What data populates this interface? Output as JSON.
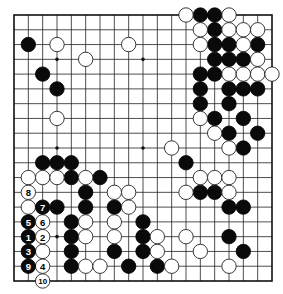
{
  "diagram": {
    "type": "go-board",
    "size": 19,
    "colors": {
      "black": "#0a0a0a",
      "white": "#ffffff",
      "lines": "#222222",
      "background": "#ffffff"
    },
    "geometry": {
      "left": 14,
      "top": 15,
      "right": 272,
      "bottom": 281,
      "stone_radius": 7.2
    },
    "star_points": [
      [
        3,
        3
      ],
      [
        9,
        3
      ],
      [
        15,
        3
      ],
      [
        3,
        9
      ],
      [
        9,
        9
      ],
      [
        15,
        9
      ],
      [
        3,
        15
      ],
      [
        9,
        15
      ],
      [
        15,
        15
      ]
    ],
    "black_stones": [
      [
        13,
        0
      ],
      [
        14,
        0
      ],
      [
        14,
        1
      ],
      [
        1,
        2
      ],
      [
        14,
        2
      ],
      [
        15,
        2
      ],
      [
        17,
        2
      ],
      [
        14,
        3
      ],
      [
        15,
        3
      ],
      [
        16,
        3
      ],
      [
        2,
        4
      ],
      [
        13,
        4
      ],
      [
        14,
        4
      ],
      [
        3,
        5
      ],
      [
        13,
        5
      ],
      [
        15,
        5
      ],
      [
        16,
        5
      ],
      [
        17,
        5
      ],
      [
        13,
        6
      ],
      [
        15,
        6
      ],
      [
        14,
        7
      ],
      [
        16,
        7
      ],
      [
        15,
        8
      ],
      [
        17,
        8
      ],
      [
        16,
        9
      ],
      [
        2,
        10
      ],
      [
        3,
        10
      ],
      [
        4,
        10
      ],
      [
        12,
        10
      ],
      [
        4,
        11
      ],
      [
        6,
        11
      ],
      [
        5,
        12
      ],
      [
        13,
        12
      ],
      [
        14,
        12
      ],
      [
        3,
        13
      ],
      [
        5,
        13
      ],
      [
        7,
        13
      ],
      [
        15,
        13
      ],
      [
        16,
        13
      ],
      [
        4,
        14
      ],
      [
        9,
        14
      ],
      [
        4,
        15
      ],
      [
        9,
        15
      ],
      [
        15,
        15
      ],
      [
        4,
        16
      ],
      [
        7,
        16
      ],
      [
        9,
        16
      ],
      [
        16,
        16
      ],
      [
        4,
        17
      ],
      [
        8,
        17
      ],
      [
        10,
        17
      ]
    ],
    "white_stones": [
      [
        12,
        0
      ],
      [
        15,
        0
      ],
      [
        13,
        1
      ],
      [
        15,
        1
      ],
      [
        16,
        1
      ],
      [
        17,
        1
      ],
      [
        3,
        2
      ],
      [
        8,
        2
      ],
      [
        13,
        2
      ],
      [
        16,
        2
      ],
      [
        5,
        3
      ],
      [
        17,
        3
      ],
      [
        15,
        4
      ],
      [
        16,
        4
      ],
      [
        17,
        4
      ],
      [
        18,
        4
      ],
      [
        3,
        7
      ],
      [
        13,
        7
      ],
      [
        14,
        8
      ],
      [
        11,
        9
      ],
      [
        15,
        9
      ],
      [
        1,
        11
      ],
      [
        2,
        11
      ],
      [
        3,
        11
      ],
      [
        5,
        11
      ],
      [
        13,
        11
      ],
      [
        14,
        11
      ],
      [
        15,
        11
      ],
      [
        7,
        12
      ],
      [
        8,
        12
      ],
      [
        12,
        12
      ],
      [
        15,
        12
      ],
      [
        1,
        13
      ],
      [
        8,
        13
      ],
      [
        5,
        14
      ],
      [
        7,
        14
      ],
      [
        5,
        15
      ],
      [
        7,
        15
      ],
      [
        10,
        15
      ],
      [
        12,
        15
      ],
      [
        2,
        16
      ],
      [
        10,
        16
      ],
      [
        13,
        16
      ],
      [
        5,
        17
      ],
      [
        6,
        17
      ],
      [
        11,
        17
      ],
      [
        15,
        17
      ]
    ],
    "numbered_moves": [
      {
        "number": "1",
        "color": "black",
        "col": 1,
        "row": 15
      },
      {
        "number": "2",
        "color": "white",
        "col": 2,
        "row": 15
      },
      {
        "number": "3",
        "color": "black",
        "col": 1,
        "row": 16
      },
      {
        "number": "4",
        "color": "white",
        "col": 2,
        "row": 17
      },
      {
        "number": "5",
        "color": "black",
        "col": 1,
        "row": 14
      },
      {
        "number": "6",
        "color": "white",
        "col": 2,
        "row": 14
      },
      {
        "number": "7",
        "color": "black",
        "col": 2,
        "row": 13
      },
      {
        "number": "8",
        "color": "white",
        "col": 1,
        "row": 12
      },
      {
        "number": "9",
        "color": "black",
        "col": 1,
        "row": 17
      },
      {
        "number": "10",
        "color": "white",
        "col": 2,
        "row": 18
      }
    ]
  }
}
